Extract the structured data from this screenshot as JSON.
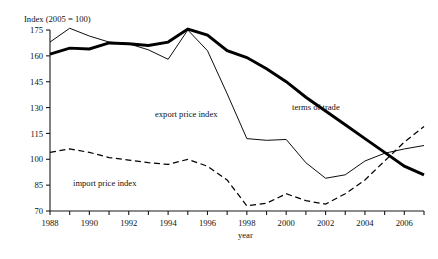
{
  "chart_data": {
    "type": "line",
    "title": "",
    "ylabel": "Index (2005 = 100)",
    "xlabel": "year",
    "grid": false,
    "legend_position": "inline-annotations",
    "xlim": [
      1988,
      2007
    ],
    "ylim": [
      70,
      175
    ],
    "yticks": [
      70,
      85,
      100,
      115,
      130,
      145,
      160,
      175
    ],
    "xticks": [
      1988,
      1989,
      1990,
      1991,
      1992,
      1993,
      1994,
      1995,
      1996,
      1997,
      1998,
      1999,
      2000,
      2001,
      2002,
      2003,
      2004,
      2005,
      2006,
      2007
    ],
    "xtick_labels_shown": [
      1988,
      1990,
      1992,
      1994,
      1996,
      1998,
      2000,
      2002,
      2004,
      2006
    ],
    "x": [
      1988,
      1989,
      1990,
      1991,
      1992,
      1993,
      1994,
      1995,
      1996,
      1997,
      1998,
      1999,
      2000,
      2001,
      2002,
      2003,
      2004,
      2005,
      2006,
      2007
    ],
    "series": [
      {
        "name": "terms of trade",
        "style": "thick-solid",
        "color": "#000000",
        "values": [
          161,
          164.5,
          164,
          167.5,
          167,
          166,
          168,
          175.5,
          172,
          163,
          159,
          152.5,
          145,
          136,
          128,
          120,
          112,
          104,
          96,
          91
        ]
      },
      {
        "name": "export price index",
        "style": "thin-solid",
        "color": "#000000",
        "values": [
          168,
          176,
          171.5,
          168,
          167,
          163.5,
          158,
          175,
          163,
          138,
          112,
          111,
          111.5,
          98,
          89,
          91,
          99,
          103.5,
          106,
          108
        ]
      },
      {
        "name": "import price index",
        "style": "dashed",
        "color": "#000000",
        "values": [
          104,
          106,
          104,
          101,
          99.5,
          98,
          97,
          100,
          96,
          88,
          73,
          74.5,
          80,
          76,
          74,
          80,
          88,
          99,
          110,
          119
        ]
      }
    ],
    "annotations": [
      {
        "text": "export price index",
        "x_px": 155,
        "y_px": 117
      },
      {
        "text": "terms of trade",
        "x_px": 292,
        "y_px": 110
      },
      {
        "text": "import price index",
        "x_px": 73,
        "y_px": 186
      }
    ]
  }
}
